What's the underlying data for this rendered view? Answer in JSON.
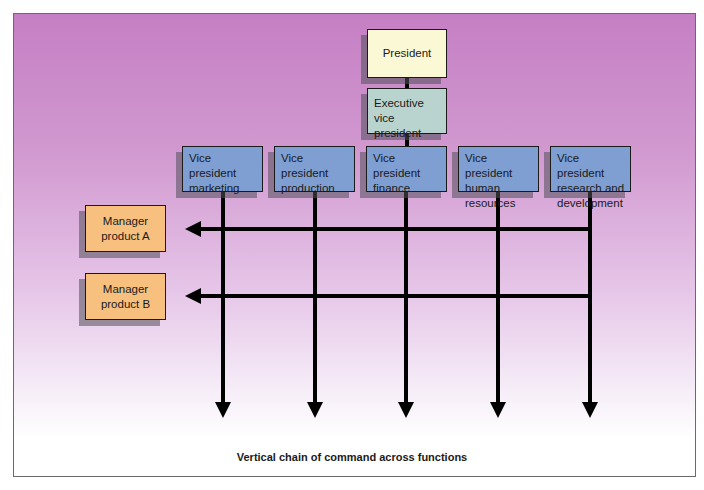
{
  "diagram": {
    "type": "matrix organization chart",
    "top": [
      {
        "id": "president",
        "label": "President"
      },
      {
        "id": "evp",
        "label": "Executive vice president"
      }
    ],
    "vice_presidents": [
      {
        "id": "vp-marketing",
        "label": "Vice president marketing"
      },
      {
        "id": "vp-production",
        "label": "Vice president production"
      },
      {
        "id": "vp-finance",
        "label": "Vice president finance"
      },
      {
        "id": "vp-hr",
        "label": "Vice president human resources"
      },
      {
        "id": "vp-rd",
        "label": "Vice president research and development"
      }
    ],
    "managers": [
      {
        "id": "manager-a",
        "label": "Manager product A"
      },
      {
        "id": "manager-b",
        "label": "Manager product B"
      }
    ],
    "caption": "Vertical chain of command across functions",
    "colors": {
      "president": "#fbf8d6",
      "evp": "#b9d3cf",
      "vp": "#7f9fd2",
      "manager": "#f7c07f",
      "background_top": "#c57fc4",
      "background_bottom": "#ffffff"
    },
    "edges": [
      [
        "president",
        "evp"
      ],
      [
        "evp",
        "vp-finance"
      ],
      [
        "vp-rd",
        "manager-a"
      ],
      [
        "vp-rd",
        "manager-b"
      ]
    ]
  }
}
